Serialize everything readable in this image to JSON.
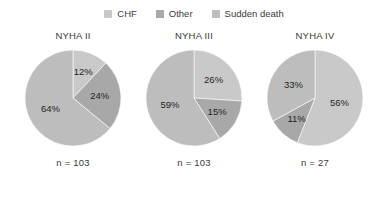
{
  "legend": {
    "items": [
      {
        "label": "CHF",
        "color": "#c9c9c9",
        "swatch_name": "legend-swatch-chf"
      },
      {
        "label": "Other",
        "color": "#a8a8a8",
        "swatch_name": "legend-swatch-other"
      },
      {
        "label": "Sudden death",
        "color": "#bdbdbd",
        "swatch_name": "legend-swatch-sudden-death"
      }
    ]
  },
  "chart_data": {
    "type": "pie",
    "title": "",
    "legend_position": "top-center",
    "grid": false,
    "series_names": [
      "CHF",
      "Other",
      "Sudden death"
    ],
    "colors": [
      "#c9c9c9",
      "#a8a8a8",
      "#bdbdbd"
    ],
    "start_angle_deg": 0,
    "direction": "clockwise",
    "value_suffix": "%",
    "charts": [
      {
        "title": "NYHA II",
        "n_label": "n = 103",
        "n": 103,
        "slices": [
          {
            "name": "CHF",
            "value": 12,
            "label": "12%"
          },
          {
            "name": "Other",
            "value": 24,
            "label": "24%"
          },
          {
            "name": "Sudden death",
            "value": 64,
            "label": "64%"
          }
        ]
      },
      {
        "title": "NYHA III",
        "n_label": "n = 103",
        "n": 103,
        "slices": [
          {
            "name": "CHF",
            "value": 26,
            "label": "26%"
          },
          {
            "name": "Other",
            "value": 15,
            "label": "15%"
          },
          {
            "name": "Sudden death",
            "value": 59,
            "label": "59%"
          }
        ]
      },
      {
        "title": "NYHA IV",
        "n_label": "n = 27",
        "n": 27,
        "slices": [
          {
            "name": "CHF",
            "value": 56,
            "label": "56%"
          },
          {
            "name": "Other",
            "value": 11,
            "label": "11%"
          },
          {
            "name": "Sudden death",
            "value": 33,
            "label": "33%"
          }
        ]
      }
    ]
  }
}
